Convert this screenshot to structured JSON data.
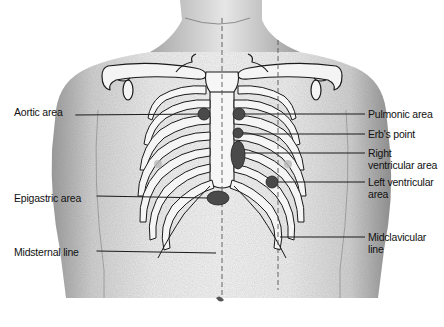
{
  "diagram": {
    "labels_left": [
      {
        "id": "aortic-area",
        "text": "Aortic area",
        "x": 14,
        "y": 110,
        "line_to": [
          205,
          114
        ]
      },
      {
        "id": "epigastric-area",
        "text": "Epigastric area",
        "x": 14,
        "y": 191,
        "line_to": [
          208,
          198
        ]
      },
      {
        "id": "midsternal-line",
        "text": "Midsternal line",
        "x": 14,
        "y": 246,
        "line_to": [
          216,
          253
        ]
      }
    ],
    "labels_right": [
      {
        "id": "pulmonic-area",
        "text": "Pulmonic area",
        "x": 368,
        "y": 108,
        "line_from": [
          244,
          114
        ]
      },
      {
        "id": "erbs-point",
        "text": "Erb's point",
        "x": 368,
        "y": 127,
        "line_from": [
          242,
          134
        ]
      },
      {
        "id": "right-ventricular-area",
        "text": "Right\nventricular area",
        "x": 368,
        "y": 147,
        "line_from": [
          244,
          153
        ]
      },
      {
        "id": "left-ventricular-area",
        "text": "Left ventricular\narea",
        "x": 368,
        "y": 175,
        "line_from": [
          276,
          182
        ]
      },
      {
        "id": "midclavicular-line",
        "text": "Midclavicular\nline",
        "x": 368,
        "y": 230,
        "line_from": [
          280,
          237
        ]
      }
    ],
    "markers": [
      {
        "id": "aortic-marker",
        "shape": "circle",
        "cx": 204,
        "cy": 114,
        "r": 6
      },
      {
        "id": "pulmonic-marker",
        "shape": "circle",
        "cx": 239,
        "cy": 114,
        "r": 6
      },
      {
        "id": "erbs-marker",
        "shape": "circle",
        "cx": 238,
        "cy": 133,
        "r": 5
      },
      {
        "id": "right-ventricular-marker",
        "shape": "ellipse",
        "cx": 238,
        "cy": 155,
        "rx": 7,
        "ry": 14
      },
      {
        "id": "left-ventricular-marker",
        "shape": "circle",
        "cx": 272,
        "cy": 182,
        "r": 6
      },
      {
        "id": "epigastric-marker",
        "shape": "ellipse",
        "cx": 218,
        "cy": 198,
        "rx": 11,
        "ry": 7
      }
    ],
    "colors": {
      "marker_fill": "#4a4a4a",
      "skin_shade": "#d8d8d8",
      "line": "#1a1a1a",
      "text": "#111111"
    }
  }
}
